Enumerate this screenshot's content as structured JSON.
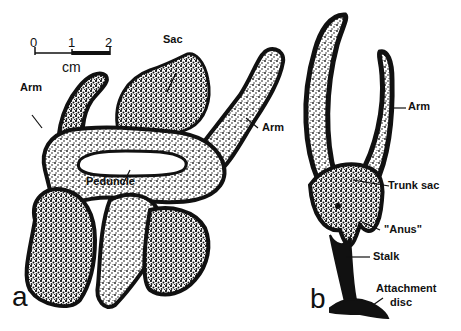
{
  "figure": {
    "panel_a": {
      "letter": "a",
      "labels": {
        "arm_left": "Arm",
        "sac": "Sac",
        "arm_right": "Arm",
        "peduncle": "Peduncle"
      },
      "scale_bar": {
        "ticks": [
          "0",
          "1",
          "2"
        ],
        "unit": "cm"
      }
    },
    "panel_b": {
      "letter": "b",
      "labels": {
        "arm": "Arm",
        "trunk_sac": "Trunk sac",
        "anus": "\"Anus\"",
        "stalk": "Stalk",
        "attachment_line1": "Attachment",
        "attachment_line2": "disc"
      }
    }
  }
}
